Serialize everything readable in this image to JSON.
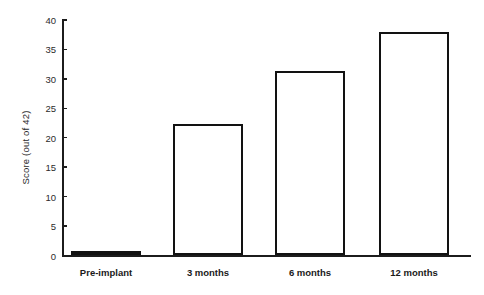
{
  "chart_data": {
    "type": "bar",
    "title": "",
    "xlabel": "",
    "ylabel": "Score (out of 42)",
    "categories": [
      "Pre-implant",
      "3 months",
      "6 months",
      "12 months"
    ],
    "values": [
      0.8,
      22.3,
      31.3,
      38.0
    ],
    "ylim": [
      0,
      40
    ],
    "yticks": [
      0,
      5,
      10,
      15,
      20,
      25,
      30,
      35,
      40
    ],
    "ytick_labels": [
      "0",
      "5",
      "10",
      "15",
      "20",
      "25",
      "30",
      "35",
      "40"
    ],
    "grid": false,
    "legend": null,
    "bar_facecolor": "#ffffff",
    "bar_edgecolor": "#121212",
    "axis_color": "#1c1c1c",
    "background": "#ffffff"
  }
}
